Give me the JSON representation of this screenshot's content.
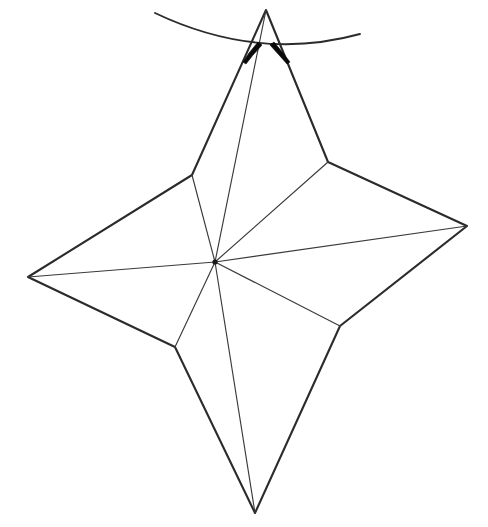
{
  "figure": {
    "title": "Four-pointed star line drawing",
    "type": "line-drawing",
    "background_color": "#ffffff",
    "stroke_color": "#2b2b2b",
    "thin_stroke_color": "#3a3a3a",
    "mark_color": "#0a0a0a",
    "canvas": {
      "width": 488,
      "height": 527
    },
    "points": {
      "apex_top": {
        "name": "top-tip",
        "x": 266,
        "y": 10
      },
      "tip_left": {
        "name": "left-tip",
        "x": 28,
        "y": 277
      },
      "tip_right": {
        "name": "right-tip",
        "x": 467,
        "y": 226
      },
      "tip_bottom": {
        "name": "bottom-tip",
        "x": 255,
        "y": 513
      },
      "vertex_upper_left": {
        "name": "upper-left-vertex",
        "x": 192,
        "y": 175
      },
      "vertex_upper_right": {
        "name": "upper-right-vertex",
        "x": 328,
        "y": 162
      },
      "vertex_lower_right": {
        "name": "lower-right-vertex",
        "x": 340,
        "y": 326
      },
      "vertex_lower_left": {
        "name": "lower-left-vertex",
        "x": 175,
        "y": 347
      },
      "hub_center": {
        "name": "center-hub",
        "x": 215,
        "y": 262
      }
    },
    "outline_path": "M 266,10 L 192,175 L 28,277 L 175,347 L 255,513 L 340,326 L 467,226 L 328,162 Z",
    "spokes": [
      {
        "name": "spoke-to-top-apex",
        "from": "hub_center",
        "to": "apex_top",
        "weight": "thin"
      },
      {
        "name": "spoke-to-upper-left-vertex",
        "from": "hub_center",
        "to": "vertex_upper_left",
        "weight": "thin"
      },
      {
        "name": "spoke-to-left-tip",
        "from": "hub_center",
        "to": "tip_left",
        "weight": "thin"
      },
      {
        "name": "spoke-to-lower-left-vertex",
        "from": "hub_center",
        "to": "vertex_lower_left",
        "weight": "thin"
      },
      {
        "name": "spoke-to-bottom-tip",
        "from": "hub_center",
        "to": "tip_bottom",
        "weight": "thin"
      },
      {
        "name": "spoke-to-lower-right-vertex",
        "from": "hub_center",
        "to": "vertex_lower_right",
        "weight": "thin"
      },
      {
        "name": "spoke-to-right-tip",
        "from": "hub_center",
        "to": "tip_right",
        "weight": "thin"
      },
      {
        "name": "spoke-to-upper-right-vertex",
        "from": "hub_center",
        "to": "vertex_upper_right",
        "weight": "thin"
      }
    ],
    "arc": {
      "name": "top-arc",
      "description": "shallow downward-bowing arc crossing behind the top apex",
      "start": {
        "x": 155,
        "y": 13
      },
      "end": {
        "x": 360,
        "y": 34
      },
      "control": {
        "x": 258,
        "y": 62
      },
      "path": "M 155,13 Q 258,62 360,34"
    },
    "tick_marks": [
      {
        "name": "left-antenna-mark",
        "description": "short thick tapered stroke slanting down-left from near apex",
        "path": "M 258,42 L 249,53 L 243,62 L 246,64 L 253,55 L 262,45 Z"
      },
      {
        "name": "right-antenna-mark",
        "description": "short thick tapered stroke slanting down-right from near apex",
        "path": "M 274,42 L 283,53 L 290,62 L 287,64 L 279,55 L 270,45 Z"
      }
    ],
    "hub_dot": {
      "name": "center-hub-dot",
      "x": 215,
      "y": 262,
      "r": 2.6
    }
  }
}
